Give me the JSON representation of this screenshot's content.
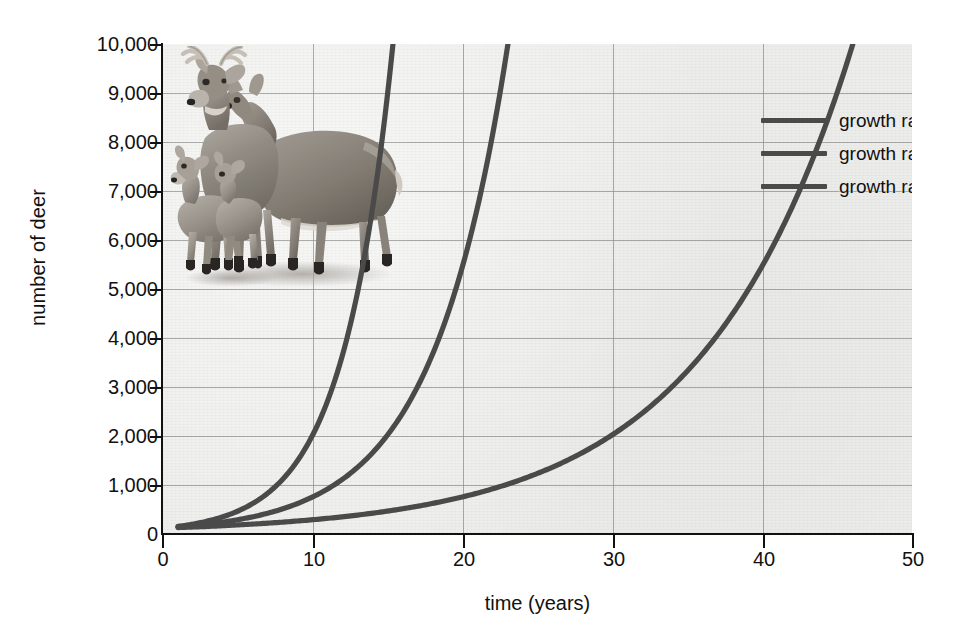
{
  "figure": {
    "background_color": "#ffffff",
    "plot_background_color": "#ededeb",
    "gridline_color": "#8e8e8e",
    "axis_color": "#111111",
    "curve_color": "#4a4a4a"
  },
  "axes": {
    "ylabel": "number of deer",
    "xlabel": "time (years)",
    "yticks": [
      "0",
      "1,000",
      "2,000",
      "3,000",
      "4,000",
      "5,000",
      "6,000",
      "7,000",
      "8,000",
      "9,000",
      "10,000"
    ],
    "xticks": [
      "0",
      "10",
      "20",
      "30",
      "40",
      "50"
    ]
  },
  "legend": {
    "items": [
      {
        "label_prefix": "growth rate (",
        "label_var": "r",
        "label_suffix": ") = 0.3",
        "full_label": "growth rate (r) = 0.3",
        "color": "#4a4a4a",
        "r": 0.3
      },
      {
        "label_prefix": "growth rate (",
        "label_var": "r",
        "label_suffix": ") = 0.2",
        "full_label": "growth rate (r) = 0.2",
        "color": "#4a4a4a",
        "r": 0.2
      },
      {
        "label_prefix": "growth rate (",
        "label_var": "r",
        "label_suffix": ") = 0.1",
        "full_label": "growth rate (r) = 0.1",
        "color": "#4a4a4a",
        "r": 0.1
      }
    ]
  },
  "illustration": {
    "name": "white-tailed-deer-family-photo",
    "description": "Black and white photo of a buck, a doe and two fawns",
    "alt": "deer family"
  },
  "chart_data": {
    "type": "line",
    "xlabel": "time (years)",
    "ylabel": "number of deer",
    "xlim": [
      0,
      50
    ],
    "ylim": [
      0,
      10000
    ],
    "xticks": [
      0,
      10,
      20,
      30,
      40,
      50
    ],
    "yticks": [
      0,
      1000,
      2000,
      3000,
      4000,
      5000,
      6000,
      7000,
      8000,
      9000,
      10000
    ],
    "grid": true,
    "legend_position": "top-right",
    "model": "N(t) = N0 * exp(r * t)",
    "initial_population": 100,
    "start_time": 1,
    "series": [
      {
        "name": "growth rate (r) = 0.3",
        "r": 0.3,
        "color": "#4a4a4a",
        "x": [
          1,
          2,
          4,
          6,
          8,
          10,
          12,
          14,
          15,
          16,
          17,
          18,
          19,
          19.4
        ],
        "values": [
          135,
          182,
          332,
          605,
          1102,
          2009,
          3660,
          6669,
          9002,
          12151,
          16400,
          22135,
          29879,
          33690
        ],
        "exits_top_at_x": 19.4
      },
      {
        "name": "growth rate (r) = 0.2",
        "r": 0.2,
        "color": "#4a4a4a",
        "x": [
          1,
          5,
          10,
          15,
          18,
          20,
          22,
          24,
          25,
          26,
          27,
          28,
          29,
          30
        ],
        "values": [
          122,
          272,
          739,
          2009,
          3660,
          5460,
          8145,
          12151,
          14841,
          18124,
          22136,
          27032,
          33009,
          40317
        ],
        "exits_top_at_x": 26.3
      },
      {
        "name": "growth rate (r) = 0.1",
        "r": 0.1,
        "color": "#4a4a4a",
        "x": [
          1,
          5,
          10,
          15,
          20,
          25,
          30,
          35,
          40,
          42,
          44,
          46,
          48,
          50
        ],
        "values": [
          111,
          165,
          272,
          448,
          739,
          1218,
          2009,
          3312,
          5460,
          6669,
          8145,
          9948,
          12151,
          14841
        ],
        "exits_top_at_x": 46.1
      }
    ]
  }
}
